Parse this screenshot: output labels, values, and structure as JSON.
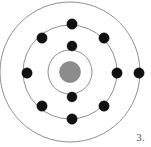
{
  "figure": {
    "kind": "bohr-atomic-model",
    "label": "3.",
    "width": 151,
    "height": 147,
    "background_color": "#ffffff"
  },
  "colors": {
    "shell_stroke": "#8f8f8f",
    "nucleus_fill": "#8c8c8c",
    "electron_fill": "#111111",
    "label_text": "#555555"
  },
  "nucleus": {
    "cx": 70,
    "cy": 72,
    "r": 10.5
  },
  "shells": [
    {
      "name": "shell-1",
      "cx": 70,
      "cy": 72,
      "r": 22,
      "electron_count": 2
    },
    {
      "name": "shell-2",
      "cx": 70,
      "cy": 72,
      "r": 47,
      "electron_count": 4
    },
    {
      "name": "shell-3",
      "cx": 70,
      "cy": 72,
      "r": 70,
      "electron_count": 7
    }
  ],
  "electrons": [
    {
      "shell": 1,
      "cx": 72,
      "cy": 46,
      "r": 5.0
    },
    {
      "shell": 1,
      "cx": 72,
      "cy": 97,
      "r": 5.0
    },
    {
      "shell": 2,
      "cx": 72,
      "cy": 24,
      "r": 5.2
    },
    {
      "shell": 2,
      "cx": 72,
      "cy": 119,
      "r": 5.2
    },
    {
      "shell": 2,
      "cx": 27,
      "cy": 73,
      "r": 5.2
    },
    {
      "shell": 2,
      "cx": 117,
      "cy": 73,
      "r": 5.2
    },
    {
      "shell": 3,
      "cx": 42,
      "cy": 38,
      "r": 5.2
    },
    {
      "shell": 3,
      "cx": 104,
      "cy": 38,
      "r": 5.2
    },
    {
      "shell": 3,
      "cx": 42,
      "cy": 106,
      "r": 5.2
    },
    {
      "shell": 3,
      "cx": 104,
      "cy": 106,
      "r": 5.2
    },
    {
      "shell": 3,
      "cx": 139,
      "cy": 73,
      "r": 5.2
    }
  ]
}
